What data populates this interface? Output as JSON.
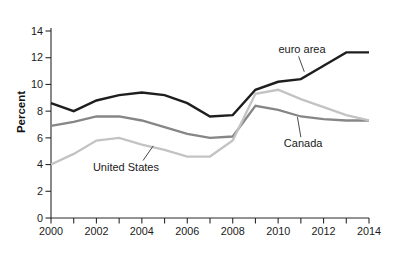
{
  "chart_data": {
    "type": "line",
    "title": "",
    "xlabel": "",
    "ylabel": "Percent",
    "xlim": [
      2000,
      2014
    ],
    "ylim": [
      0,
      14
    ],
    "grid": false,
    "legend_position": "inline-annotations",
    "x": [
      2000,
      2001,
      2002,
      2003,
      2004,
      2005,
      2006,
      2007,
      2008,
      2009,
      2010,
      2011,
      2012,
      2013,
      2014
    ],
    "x_tick_labels": [
      2000,
      2002,
      2004,
      2006,
      2008,
      2010,
      2012,
      2014
    ],
    "y_ticks": [
      0,
      2,
      4,
      6,
      8,
      10,
      12,
      14
    ],
    "axis_color": "#2a2a2a",
    "tick_label_color": "#1a1a1a",
    "annotation_line_color": "#333333",
    "series": [
      {
        "name": "Canada",
        "color": "#868686",
        "width": 2.3,
        "values": [
          6.9,
          7.2,
          7.6,
          7.6,
          7.3,
          6.8,
          6.3,
          6.0,
          6.1,
          8.4,
          8.1,
          7.6,
          7.4,
          7.3,
          7.3
        ]
      },
      {
        "name": "United States",
        "color": "#c3c3c3",
        "width": 2.3,
        "values": [
          4.0,
          4.8,
          5.8,
          6.0,
          5.5,
          5.1,
          4.6,
          4.6,
          5.8,
          9.3,
          9.6,
          8.9,
          8.3,
          7.7,
          7.3
        ]
      },
      {
        "name": "euro area",
        "color": "#1e1e1e",
        "width": 2.4,
        "values": [
          8.6,
          8.0,
          8.8,
          9.2,
          9.4,
          9.2,
          8.6,
          7.6,
          7.7,
          9.6,
          10.2,
          10.4,
          11.4,
          12.4,
          12.4
        ]
      }
    ],
    "annotations": [
      {
        "text": "euro area",
        "text_x": 2011.05,
        "text_y": 12.65,
        "line": [
          2010.9,
          12.1,
          2011.15,
          10.95
        ]
      },
      {
        "text": "Canada",
        "text_x": 2011.1,
        "text_y": 5.6,
        "line": [
          2011.0,
          6.05,
          2010.85,
          7.55
        ]
      },
      {
        "text": "United States",
        "text_x": 2003.3,
        "text_y": 3.8,
        "line": [
          2004.05,
          4.3,
          2004.5,
          5.4
        ]
      }
    ]
  }
}
